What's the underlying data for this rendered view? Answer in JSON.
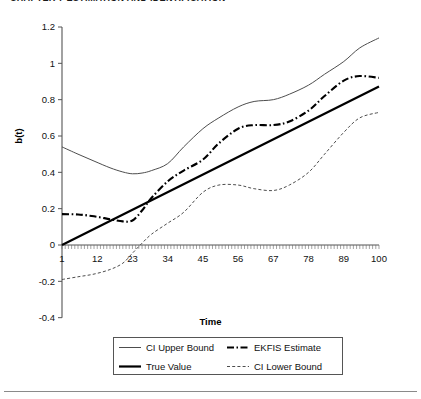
{
  "running_head": "CHAPTER 7  ESTIMATION AND IDENTIFICATION",
  "axis_title_x": "Time",
  "axis_title_y": "b(t)",
  "legend": {
    "items": [
      {
        "label": "CI Upper Bound",
        "style": "thin-solid",
        "color": "#4d4d4d"
      },
      {
        "label": "EKFIS Estimate",
        "style": "bold-dashdot",
        "color": "#000000"
      },
      {
        "label": "True Value",
        "style": "bold-solid",
        "color": "#000000"
      },
      {
        "label": "CI Lower Bound",
        "style": "thin-dashed",
        "color": "#4d4d4d"
      }
    ]
  },
  "chart_data": {
    "type": "line",
    "title": "",
    "xlabel": "Time",
    "ylabel": "b(t)",
    "xlim": [
      1,
      100
    ],
    "ylim": [
      -0.4,
      1.2
    ],
    "grid": false,
    "legend_position": "bottom",
    "xticks": [
      1,
      12,
      23,
      34,
      45,
      56,
      67,
      78,
      89,
      100
    ],
    "yticks": [
      -0.4,
      -0.2,
      0,
      0.2,
      0.4,
      0.6,
      0.8,
      1,
      1.2
    ],
    "x": [
      1,
      6,
      11,
      16,
      20,
      23,
      26,
      29,
      34,
      39,
      45,
      50,
      56,
      61,
      67,
      72,
      78,
      83,
      89,
      94,
      100
    ],
    "series": [
      {
        "name": "CI Upper Bound",
        "style": "thin-solid",
        "color": "#4d4d4d",
        "values": [
          0.54,
          0.5,
          0.462,
          0.425,
          0.402,
          0.392,
          0.396,
          0.41,
          0.448,
          0.54,
          0.64,
          0.7,
          0.76,
          0.79,
          0.8,
          0.83,
          0.88,
          0.94,
          1.01,
          1.085,
          1.14
        ]
      },
      {
        "name": "True Value",
        "style": "bold-solid",
        "color": "#000000",
        "values": [
          0.0,
          0.044,
          0.088,
          0.132,
          0.167,
          0.193,
          0.22,
          0.246,
          0.29,
          0.334,
          0.387,
          0.431,
          0.484,
          0.528,
          0.581,
          0.625,
          0.678,
          0.722,
          0.775,
          0.819,
          0.872
        ]
      },
      {
        "name": "EKFIS Estimate",
        "style": "bold-dashdot",
        "color": "#000000",
        "values": [
          0.17,
          0.168,
          0.158,
          0.142,
          0.13,
          0.135,
          0.19,
          0.26,
          0.35,
          0.41,
          0.47,
          0.56,
          0.64,
          0.66,
          0.66,
          0.68,
          0.74,
          0.82,
          0.905,
          0.93,
          0.92
        ]
      },
      {
        "name": "CI Lower Bound",
        "style": "thin-dashed",
        "color": "#4d4d4d",
        "values": [
          -0.19,
          -0.175,
          -0.16,
          -0.135,
          -0.1,
          -0.045,
          0.01,
          0.06,
          0.12,
          0.18,
          0.29,
          0.33,
          0.33,
          0.31,
          0.3,
          0.33,
          0.4,
          0.5,
          0.62,
          0.7,
          0.73
        ]
      }
    ]
  }
}
